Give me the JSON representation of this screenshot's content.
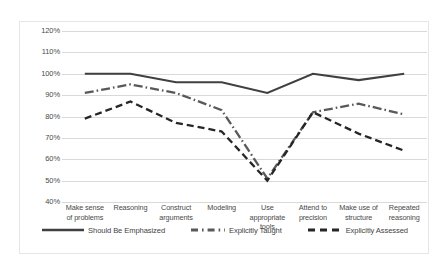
{
  "chart_data": {
    "type": "line",
    "title": "",
    "xlabel": "",
    "ylabel": "",
    "ylim": [
      40,
      120
    ],
    "ytick_labels": [
      "120%",
      "110%",
      "100%",
      "90%",
      "80%",
      "70%",
      "60%",
      "50%",
      "40%"
    ],
    "ytick_values": [
      120,
      110,
      100,
      90,
      80,
      70,
      60,
      50,
      40
    ],
    "grid": true,
    "legend_position": "bottom",
    "categories": [
      "Make sense of problems",
      "Reasoning",
      "Construct arguments",
      "Modeling",
      "Use appropriate tools",
      "Attend to precision",
      "Make use of structure",
      "Repeated reasoning"
    ],
    "category_lines": [
      [
        "Make sense",
        "of problems"
      ],
      [
        "Reasoning"
      ],
      [
        "Construct",
        "arguments"
      ],
      [
        "Modeling"
      ],
      [
        "Use",
        "appropriate",
        "tools"
      ],
      [
        "Attend to",
        "precision"
      ],
      [
        "Make use of",
        "structure"
      ],
      [
        "Repeated",
        "reasoning"
      ]
    ],
    "series": [
      {
        "name": "Should Be Emphasized",
        "style": "solid",
        "color": "#404040",
        "values": [
          100,
          100,
          96,
          96,
          91,
          100,
          97,
          100
        ]
      },
      {
        "name": "Explicitly Taught",
        "style": "dash-dot",
        "color": "#595959",
        "values": [
          91,
          95,
          91,
          83,
          51,
          82,
          86,
          81
        ]
      },
      {
        "name": "Explicitly Assessed",
        "style": "dashed",
        "color": "#262626",
        "values": [
          79,
          87,
          77,
          73,
          50,
          82,
          72,
          64
        ]
      }
    ]
  }
}
